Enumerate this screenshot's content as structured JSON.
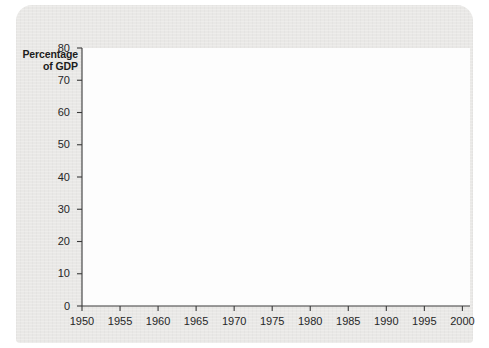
{
  "figure": {
    "y_axis_title_line1": "Percentage",
    "y_axis_title_line2": "of GDP",
    "background_color": "#e9e8e6",
    "plot_background_color": "#fdfdfd"
  },
  "chart_data": {
    "type": "line",
    "title": "",
    "xlabel": "",
    "ylabel": "Percentage of GDP",
    "xlim": [
      1950,
      2001
    ],
    "ylim": [
      0,
      80
    ],
    "xticks": [
      1950,
      1955,
      1960,
      1965,
      1970,
      1975,
      1980,
      1985,
      1990,
      1995,
      2000
    ],
    "yticks": [
      0,
      10,
      20,
      30,
      40,
      50,
      60,
      70,
      80
    ],
    "xtick_labels": [
      "1950",
      "1955",
      "1960",
      "1965",
      "1970",
      "1975",
      "1980",
      "1985",
      "1990",
      "1995",
      "2000"
    ],
    "ytick_labels": [
      "0",
      "10",
      "20",
      "30",
      "40",
      "50",
      "60",
      "70",
      "80"
    ],
    "grid": false,
    "legend_position": "inline-annotation",
    "series": [
      {
        "name": "Federal government debt",
        "color": "#2b2b2b",
        "label_x": 1972.2,
        "label_y": 47.0,
        "x": [
          1950,
          1951,
          1952,
          1953,
          1954,
          1955,
          1956,
          1957,
          1958,
          1959,
          1960,
          1961,
          1962,
          1963,
          1964,
          1965,
          1966,
          1967,
          1968,
          1969,
          1970,
          1971,
          1972,
          1973,
          1974,
          1975,
          1976,
          1977,
          1978,
          1979,
          1980,
          1981,
          1982,
          1983,
          1984,
          1985,
          1986,
          1987,
          1988,
          1989,
          1990,
          1991,
          1992,
          1993,
          1994,
          1995,
          1996,
          1997,
          1998,
          1999,
          2000,
          2001
        ],
        "values": [
          67.0,
          59.0,
          52.0,
          47.5,
          44.5,
          42.5,
          42.8,
          39.0,
          35.5,
          33.0,
          32.3,
          32.5,
          32.7,
          32.3,
          32.2,
          32.6,
          32.3,
          32.2,
          30.0,
          28.0,
          26.5,
          25.8,
          24.8,
          23.6,
          22.3,
          20.8,
          18.8,
          17.0,
          16.8,
          16.8,
          18.8,
          21.5,
          24.5,
          27.0,
          27.8,
          35.0,
          40.0,
          44.5,
          49.5,
          53.5,
          55.0,
          55.5,
          55.2,
          57.5,
          63.0,
          68.5,
          71.5,
          72.2,
          71.5,
          68.0,
          63.5,
          59.5
        ]
      },
      {
        "name": "Provincial government debt",
        "color": "#8d8d8d",
        "label_x": 1986.0,
        "label_y": 8.5,
        "x": [
          1971,
          1972,
          1973,
          1974,
          1975,
          1976,
          1977,
          1978,
          1979,
          1980,
          1981,
          1982,
          1983,
          1984,
          1985,
          1986,
          1987,
          1988,
          1989,
          1990,
          1991,
          1992,
          1993,
          1994,
          1995,
          1996,
          1997,
          1998,
          1999,
          2000,
          2001
        ],
        "values": [
          5.2,
          6.3,
          6.5,
          6.4,
          6.1,
          6.4,
          7.0,
          7.6,
          7.8,
          7.5,
          7.5,
          7.8,
          6.8,
          9.3,
          12.0,
          14.2,
          16.0,
          18.5,
          18.0,
          17.6,
          18.0,
          20.5,
          24.0,
          27.0,
          29.2,
          30.0,
          29.9,
          29.5,
          29.0,
          29.3,
          28.8
        ]
      }
    ]
  }
}
